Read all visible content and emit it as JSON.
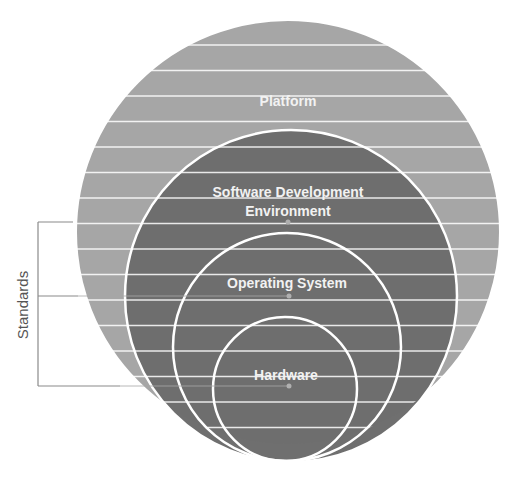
{
  "diagram": {
    "type": "nested-circles",
    "colors": {
      "outer_fill": "#a6a6a6",
      "inner_fill": "#6f6f6f",
      "ring_stroke": "#ffffff",
      "stripe": "#ffffff",
      "bracket": "#8a8a8a",
      "dot": "#b0b0b0"
    },
    "layers": [
      {
        "label": "Platform",
        "level": 1
      },
      {
        "label_line1": "Software Development",
        "label_line2": "Environment",
        "level": 2
      },
      {
        "label": "Operating System",
        "level": 3
      },
      {
        "label": "Hardware",
        "level": 4
      }
    ],
    "bracket": {
      "label": "Standards",
      "connects": [
        "Software Development Environment",
        "Operating System",
        "Hardware"
      ]
    }
  }
}
